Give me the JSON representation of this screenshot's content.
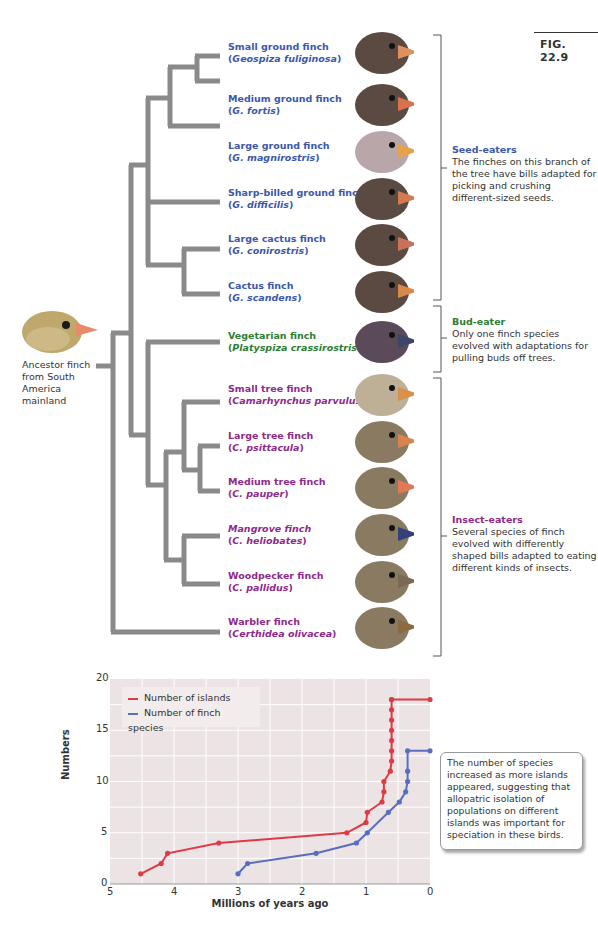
{
  "figure": {
    "label": "FIG. 22.9"
  },
  "ancestor": {
    "label": "Ancestor finch from South America mainland"
  },
  "species": [
    {
      "common": "Small ground finch",
      "scientific_prefix": "",
      "scientific": "Geospiza fuliginosa",
      "group": "seed",
      "top": 41,
      "bill": "#e0905e"
    },
    {
      "common": "Medium ground finch",
      "scientific_prefix": "",
      "scientific": "G. fortis",
      "group": "seed",
      "top": 93,
      "bill": "#d9704e"
    },
    {
      "common": "Large ground finch",
      "scientific_prefix": "",
      "scientific": "G. magnirostris",
      "group": "seed",
      "top": 140,
      "bill": "#e6a24a"
    },
    {
      "common": "Sharp-billed ground finch",
      "scientific_prefix": "",
      "scientific": "G. difficilis",
      "group": "seed",
      "top": 187,
      "bill": "#d07c50"
    },
    {
      "common": "Large cactus finch",
      "scientific_prefix": "",
      "scientific": "G. conirostris",
      "group": "seed",
      "top": 233,
      "bill": "#c9725a"
    },
    {
      "common": "Cactus finch",
      "scientific_prefix": "",
      "scientific": "G. scandens",
      "group": "seed",
      "top": 280,
      "bill": "#d98a4a"
    },
    {
      "common": "Vegetarian finch",
      "scientific_prefix": "",
      "scientific": "Platyspiza crassirostris",
      "group": "bud",
      "top": 330,
      "bill": "#3d4666"
    },
    {
      "common": "Small tree finch",
      "scientific_prefix": "",
      "scientific": "Camarhynchus parvulus",
      "group": "insect",
      "top": 383,
      "bill": "#d9904a"
    },
    {
      "common": "Large tree finch",
      "scientific_prefix": "",
      "scientific": "C. psittacula",
      "group": "insect",
      "top": 430,
      "bill": "#d9844e"
    },
    {
      "common": "Medium tree finch",
      "scientific_prefix": "",
      "scientific": "C. pauper",
      "group": "insect",
      "top": 476,
      "bill": "#e07a56"
    },
    {
      "common": "Mangrove finch",
      "scientific_prefix": "",
      "scientific": "C. heliobates",
      "group": "insect",
      "top": 523,
      "bill": "#34407a",
      "italic_common": true
    },
    {
      "common": "Woodpecker finch",
      "scientific_prefix": "",
      "scientific": "C. pallidus",
      "group": "insect",
      "top": 570,
      "bill": "#7a6a55"
    },
    {
      "common": "Warbler finch",
      "scientific_prefix": "",
      "scientific": "Certhidea olivacea",
      "group": "insect",
      "top": 616,
      "bill": "#8a6a3e"
    }
  ],
  "groups": {
    "seed": {
      "title": "Seed-eaters",
      "text": "The finches on this branch of the tree have bills adapted for picking and crushing different-sized seeds.",
      "color": "#3b58a8"
    },
    "bud": {
      "title": "Bud-eater",
      "text": "Only one finch species evolved with adaptations for pulling buds off trees.",
      "color": "#2e7d32"
    },
    "insect": {
      "title": "Insect-eaters",
      "text": "Several species of finch evolved with differently shaped bills adapted to eating different kinds of insects.",
      "color": "#8e2a8a"
    }
  },
  "chart_note": "The number of species increased as more islands appeared, suggesting that allopatric isolation of populations on different islands was important for speciation in these birds.",
  "chart_data": {
    "type": "line",
    "title": "",
    "xlabel": "Millions of years ago",
    "ylabel": "Numbers",
    "xlim": [
      5,
      0
    ],
    "ylim": [
      0,
      20
    ],
    "x_ticks": [
      "5",
      "4",
      "3",
      "2",
      "1",
      "0"
    ],
    "y_ticks": [
      "0",
      "5",
      "10",
      "15",
      "20"
    ],
    "grid": true,
    "legend_position": "upper-left",
    "series": [
      {
        "name": "Number of islands",
        "color": "#e03a45",
        "x": [
          4.52,
          4.2,
          4.1,
          3.3,
          1.3,
          1.0,
          0.98,
          0.75,
          0.72,
          0.72,
          0.62,
          0.6,
          0.6,
          0.6,
          0.6,
          0.6,
          0.6,
          0.6,
          0.6,
          0.0
        ],
        "y": [
          1,
          2,
          3,
          4,
          5,
          6,
          7,
          8,
          9,
          10,
          11,
          12,
          13,
          14,
          15,
          16,
          17,
          18,
          18,
          18
        ]
      },
      {
        "name": "Number of finch species",
        "color": "#5a6ec0",
        "x": [
          3.0,
          2.85,
          1.78,
          1.15,
          0.98,
          0.65,
          0.48,
          0.38,
          0.35,
          0.35,
          0.35,
          0.0
        ],
        "y": [
          1,
          2,
          3,
          4,
          5,
          7,
          8,
          9,
          10,
          11,
          13,
          13
        ]
      }
    ]
  }
}
